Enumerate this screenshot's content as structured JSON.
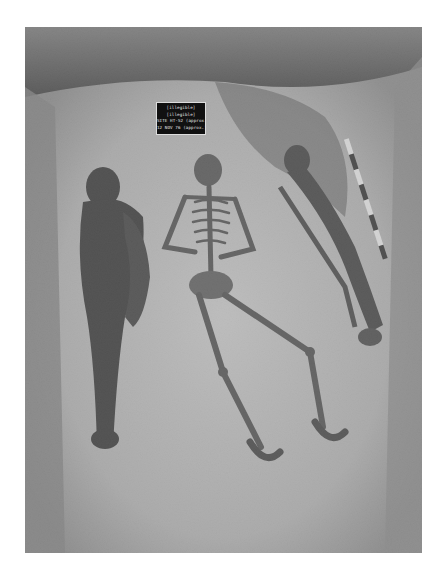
{
  "photo": {
    "subject": "Archaeological burial excavation with three skeletons",
    "description": "Black-and-white photograph of an excavation trench showing three extended burials side by side, a photo label board, and a striped scale bar.",
    "colors": {
      "soil_light": "#c8c8c8",
      "soil_mid": "#9a9a9a",
      "soil_dark": "#3a3a3a",
      "bone": "#5a5a5a",
      "sign_bg": "#111111"
    }
  },
  "sign": {
    "legibility": "text not legible at screenshot resolution; lines below are approximate readings",
    "lines": [
      "[illegible]",
      "[illegible]",
      "SITE HT-52 (approx.)",
      "12 NOV 76 (approx.)"
    ]
  },
  "features": {
    "skeletons": [
      {
        "position": "left",
        "label": "burial-left"
      },
      {
        "position": "center",
        "label": "burial-center"
      },
      {
        "position": "right",
        "label": "burial-right"
      }
    ],
    "scale_bar": {
      "segments": 5,
      "colors": [
        "#f0f0f0",
        "#2a2a2a"
      ]
    }
  }
}
